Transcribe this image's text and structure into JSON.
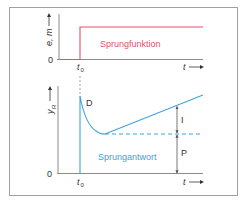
{
  "colors": {
    "step_function": "#e0506e",
    "step_response": "#3ea2d8",
    "axis": "#8c8c8c",
    "frame": "#a0a0a0",
    "text": "#333333"
  },
  "top_chart": {
    "y_label": "e, m",
    "zero_label": "0",
    "x_label": "t",
    "t0_label": "t",
    "t0_sub": "0",
    "curve_label": "Sprungfunktion"
  },
  "bottom_chart": {
    "y_label": "y",
    "y_sub": "R",
    "zero_label": "0",
    "x_label": "t",
    "t0_label": "t",
    "t0_sub": "0",
    "curve_label": "Sprungantwort",
    "d_label": "D",
    "i_label": "I",
    "p_label": "P"
  }
}
